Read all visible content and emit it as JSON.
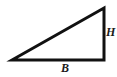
{
  "figure": {
    "background_color": "#ffffff",
    "stroke_color": "#111111",
    "stroke_width": 3,
    "width": 117,
    "height": 77
  },
  "labels": {
    "height": "H",
    "base": "B"
  },
  "chart_data": {
    "type": "diagram",
    "shape": "right-triangle",
    "vertices": [
      {
        "name": "left-vertex",
        "x": 12,
        "y": 60
      },
      {
        "name": "top-right-vertex",
        "x": 104,
        "y": 8
      },
      {
        "name": "bottom-right-vertex",
        "x": 104,
        "y": 60
      }
    ],
    "edges": [
      {
        "name": "base",
        "label": "B",
        "from": "left-vertex",
        "to": "bottom-right-vertex",
        "orientation": "horizontal"
      },
      {
        "name": "height",
        "label": "H",
        "from": "bottom-right-vertex",
        "to": "top-right-vertex",
        "orientation": "vertical"
      },
      {
        "name": "hypotenuse",
        "label": "",
        "from": "left-vertex",
        "to": "top-right-vertex",
        "orientation": "diagonal"
      }
    ],
    "right_angle_at": "bottom-right-vertex",
    "annotations": [
      "H",
      "B"
    ],
    "grid": false,
    "legend": false
  }
}
